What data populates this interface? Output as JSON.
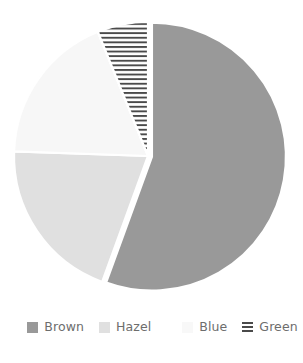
{
  "chart_data": {
    "type": "pie",
    "title": "",
    "subtitle": "",
    "xlabel": "",
    "ylabel": "",
    "grid": false,
    "legend_position": "bottom",
    "start_angle_deg": 0,
    "direction": "clockwise",
    "center": {
      "x": 148,
      "y": 156
    },
    "radius": 134,
    "categories": [
      "Brown",
      "Hazel",
      "Blue",
      "Green"
    ],
    "values": [
      55.6,
      20.0,
      18.3,
      6.1
    ],
    "units": "percent",
    "slices": [
      {
        "label": "Brown",
        "value": 55.6,
        "start_angle_deg": 0,
        "end_angle_deg": 200,
        "color": "#999999",
        "pattern": "solid",
        "exploded": true,
        "explode_offset": 4
      },
      {
        "label": "Hazel",
        "value": 20.0,
        "start_angle_deg": 200,
        "end_angle_deg": 272,
        "color": "#e0e0e0",
        "pattern": "solid",
        "exploded": false,
        "explode_offset": 0
      },
      {
        "label": "Blue",
        "value": 18.3,
        "start_angle_deg": 272,
        "end_angle_deg": 338,
        "color": "#f7f7f7",
        "pattern": "solid",
        "exploded": false,
        "explode_offset": 0
      },
      {
        "label": "Green",
        "value": 6.1,
        "start_angle_deg": 338,
        "end_angle_deg": 360,
        "color": "#ffffff",
        "pattern": "horizontal-hatch",
        "hatch_color": "#4a4a4a",
        "exploded": false,
        "explode_offset": 0
      }
    ]
  },
  "legend": {
    "items": [
      {
        "label": "Brown",
        "swatch_color": "#999999",
        "swatch_pattern": "solid",
        "swatch_name": "legend-swatch-brown"
      },
      {
        "label": "Hazel",
        "swatch_color": "#e0e0e0",
        "swatch_pattern": "solid",
        "swatch_name": "legend-swatch-hazel"
      },
      {
        "label": "Blue",
        "swatch_color": "#f8f8f8",
        "swatch_pattern": "solid",
        "swatch_name": "legend-swatch-blue"
      },
      {
        "label": "Green",
        "swatch_color": "#ffffff",
        "swatch_pattern": "horizontal-hatch",
        "swatch_name": "legend-swatch-green"
      }
    ]
  },
  "colors": {
    "background": "#ffffff",
    "legend_text": "#6d6d6d",
    "brown": "#999999",
    "hazel": "#e0e0e0",
    "blue": "#f7f7f7",
    "green_hatch": "#4a4a4a"
  }
}
